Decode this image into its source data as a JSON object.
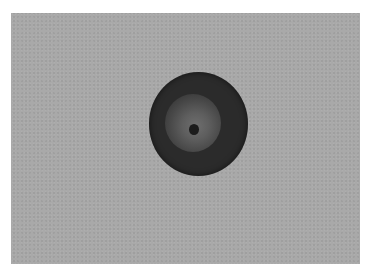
{
  "image": {
    "description": "Grayscale photograph of a dark circular object with a lighter halo and a dark central dot on a uniform gray background, framed by a white border",
    "colors": {
      "border": "#ffffff",
      "background": "#a9a9a9",
      "object": "#2b2b2b",
      "halo": "#6e6e6e",
      "center_dot": "#1c1c1c"
    }
  }
}
